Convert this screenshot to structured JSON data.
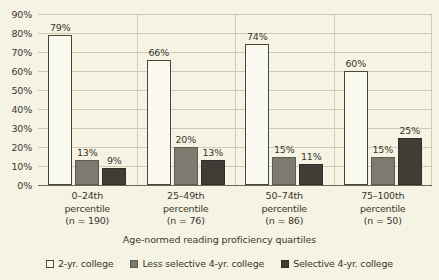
{
  "chart_data": {
    "type": "bar",
    "title": "",
    "subtitle": "",
    "xlabel": "Age-normed reading proficiency quartiles",
    "ylabel": "",
    "ylim": [
      0,
      90
    ],
    "ytick_step": 10,
    "grid": true,
    "legend_position": "bottom",
    "categories": [
      "0–24th percentile (n = 190)",
      "25–49th percentile (n = 76)",
      "50–74th percentile (n = 86)",
      "75–100th percentile (n = 50)"
    ],
    "category_lines": [
      [
        "0–24th",
        "percentile",
        "(n = 190)"
      ],
      [
        "25–49th",
        "percentile",
        "(n = 76)"
      ],
      [
        "50–74th",
        "percentile",
        "(n = 86)"
      ],
      [
        "75–100th",
        "percentile",
        "(n = 50)"
      ]
    ],
    "ytick_labels": [
      "90%",
      "80%",
      "70%",
      "60%",
      "50%",
      "40%",
      "30%",
      "20%",
      "10%",
      "0%"
    ],
    "ytick_values": [
      90,
      80,
      70,
      60,
      50,
      40,
      30,
      20,
      10,
      0
    ],
    "series": [
      {
        "name": "2-yr. college",
        "color": "#fbfaf0",
        "values": [
          79,
          66,
          74,
          60
        ],
        "data_labels": [
          "79%",
          "66%",
          "74%",
          "60%"
        ]
      },
      {
        "name": "Less selective 4-yr. college",
        "color": "#7d7a70",
        "values": [
          13,
          20,
          15,
          15
        ],
        "data_labels": [
          "13%",
          "20%",
          "15%",
          "15%"
        ]
      },
      {
        "name": "Selective 4-yr. college",
        "color": "#403d36",
        "values": [
          9,
          13,
          11,
          25
        ],
        "data_labels": [
          "9%",
          "13%",
          "11%",
          "25%"
        ]
      }
    ]
  },
  "colors": {
    "background": "#f5f3e4",
    "gridline": "#cfcbb4",
    "axis": "#6b6757",
    "text": "#3a362c"
  }
}
